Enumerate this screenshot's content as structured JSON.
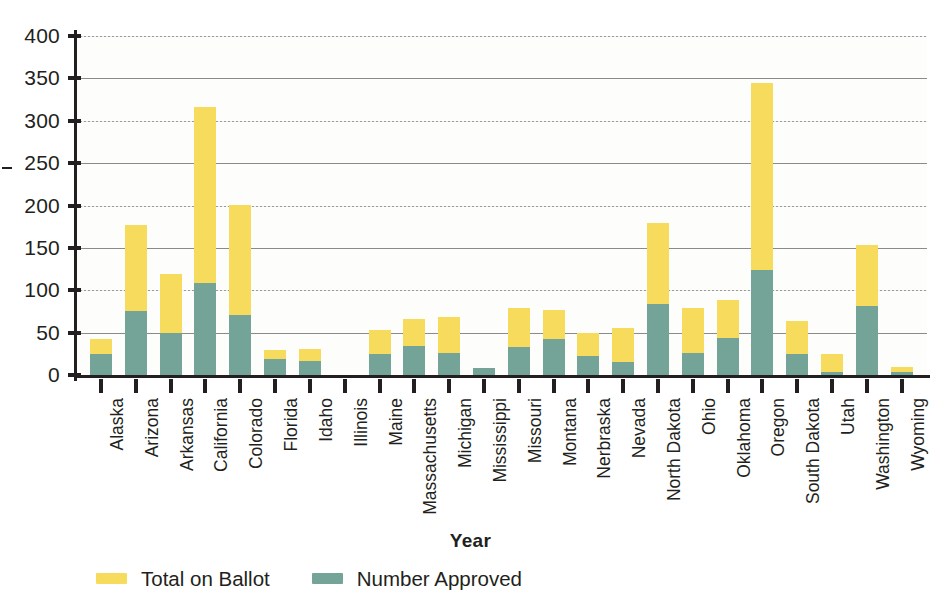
{
  "chart_data": {
    "type": "bar",
    "stacked": true,
    "title": "",
    "xlabel": "Year",
    "ylabel": "",
    "ylim": [
      0,
      400
    ],
    "yticks": [
      0,
      50,
      100,
      150,
      200,
      250,
      300,
      350,
      400
    ],
    "grid": true,
    "legend_position": "bottom-left",
    "categories": [
      "Alaska",
      "Arizona",
      "Arkansas",
      "California",
      "Colorado",
      "Florida",
      "Idaho",
      "Illinois",
      "Maine",
      "Massachusetts",
      "Michigan",
      "Mississippi",
      "Missouri",
      "Montana",
      "Nerbraska",
      "Nevada",
      "North Dakota",
      "Ohio",
      "Oklahoma",
      "Oregon",
      "South Dakota",
      "Utah",
      "Washington",
      "Wyoming"
    ],
    "series": [
      {
        "name": "Total on Ballot",
        "color": "#f6db5c",
        "values": [
          43,
          177,
          119,
          316,
          201,
          30,
          31,
          0,
          53,
          66,
          69,
          8,
          79,
          77,
          49,
          55,
          179,
          79,
          88,
          345,
          64,
          25,
          154,
          10
        ]
      },
      {
        "name": "Number Approved",
        "color": "#73a497",
        "values": [
          25,
          76,
          49,
          108,
          71,
          19,
          17,
          0,
          25,
          34,
          26,
          8,
          33,
          43,
          22,
          15,
          84,
          26,
          44,
          124,
          25,
          4,
          81,
          3
        ]
      }
    ]
  },
  "legend": {
    "items": [
      {
        "label": "Total on Ballot",
        "color": "#f6db5c"
      },
      {
        "label": "Number Approved",
        "color": "#73a497"
      }
    ]
  },
  "axis": {
    "x_title": "Year"
  },
  "colors": {
    "total_on_ballot": "#f6db5c",
    "number_approved": "#73a497",
    "axis": "#231f20",
    "gridline": "#8b8b8b",
    "plot_background": "#fdfdfc"
  }
}
